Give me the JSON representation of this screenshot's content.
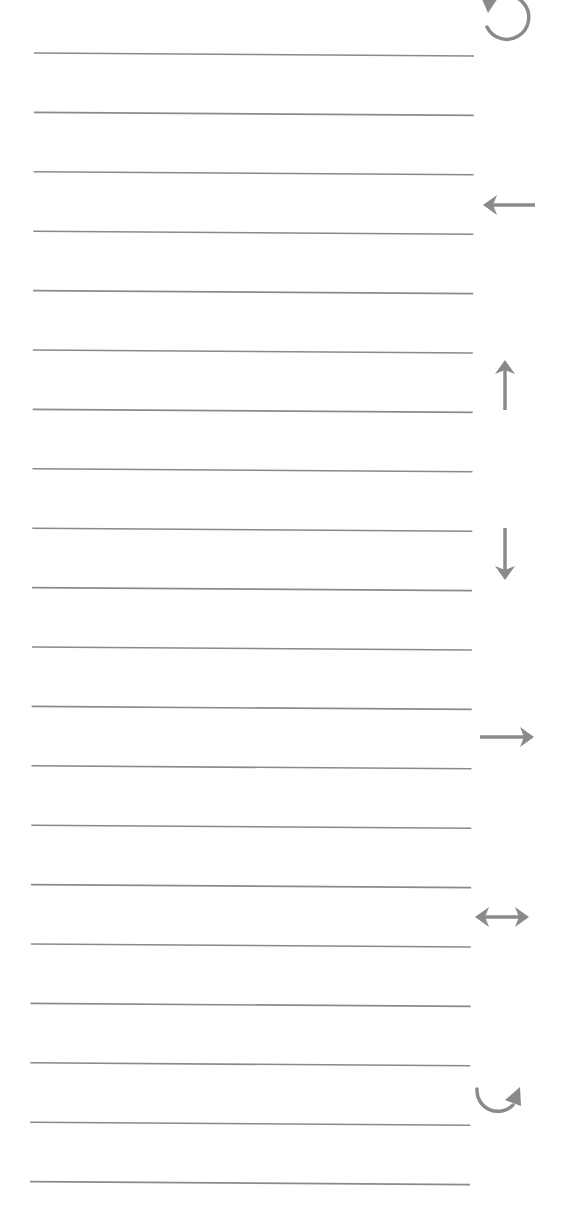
{
  "sheet": {
    "background": "#ffffff",
    "line_color": "#8a8a8a",
    "icon_color": "#8a8a8a",
    "line_count": 20,
    "first_line_y": 53,
    "line_spacing": 59.4,
    "line_x_start": 34,
    "line_x_end": 474
  },
  "icons": [
    {
      "name": "rotate-counterclockwise-icon",
      "cx": 505,
      "cy": 22
    },
    {
      "name": "arrow-left-icon",
      "cx": 510,
      "cy": 205
    },
    {
      "name": "arrow-up-icon",
      "cx": 505,
      "cy": 385
    },
    {
      "name": "arrow-down-icon",
      "cx": 505,
      "cy": 555
    },
    {
      "name": "arrow-right-icon",
      "cx": 507,
      "cy": 737
    },
    {
      "name": "arrow-left-right-icon",
      "cx": 502,
      "cy": 917
    },
    {
      "name": "curved-arrow-clockwise-icon",
      "cx": 498,
      "cy": 1098
    }
  ]
}
